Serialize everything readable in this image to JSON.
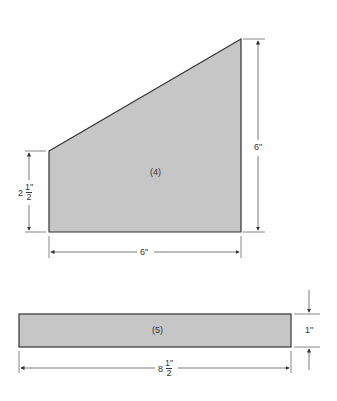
{
  "colors": {
    "fill": "#c6c6c6",
    "stroke": "#333333",
    "dim": "#444444"
  },
  "piece4": {
    "label": "(4)",
    "width_dim": "6\"",
    "height_dim": "6\"",
    "left_height_whole": "2",
    "left_height_num": "1\"",
    "left_height_den": "2"
  },
  "piece5": {
    "label": "(5)",
    "height_dim": "1\"",
    "length_whole": "8",
    "length_num": "1\"",
    "length_den": "2"
  }
}
